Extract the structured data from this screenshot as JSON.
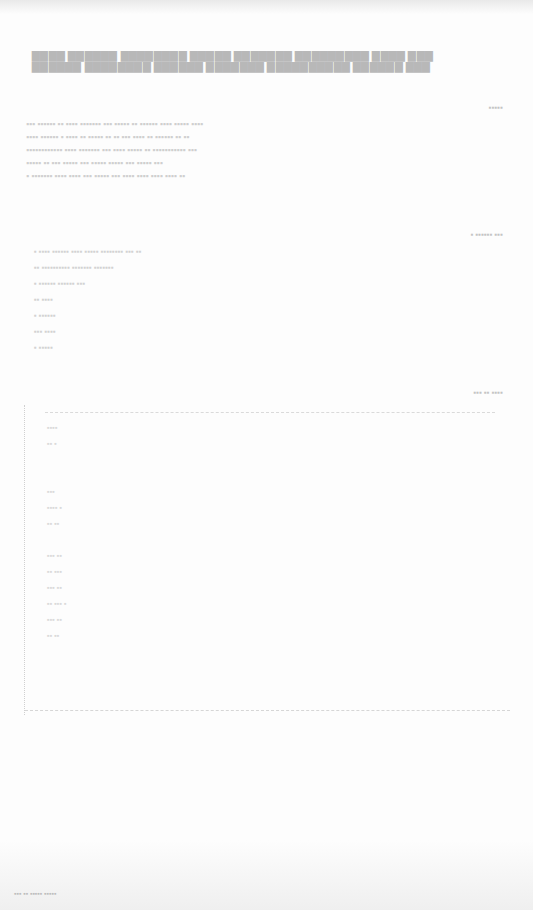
{
  "document": {
    "header_lines": [
      "▇▇▇▇ ▇▇▇▇▇▇ ▇▇▇▇▇▇▇▇ ▇▇▇▇▇ ▇▇▇▇▇▇▇ ▇▇▇▇▇▇▇▇▇ ▇▇▇▇ ▇▇▇",
      "▇▇▇▇▇▇ ▇▇▇▇▇▇▇▇ ▇▇▇▇▇▇ ▇▇▇▇▇▇▇ ▇▇▇▇▇▇▇▇▇▇ ▇▇▇▇▇▇ ▇▇▇"
    ],
    "label_1": "▪▪▪▪▪",
    "paragraph": [
      "▪▪▪ ▪▪▪▪▪▪ ▪▪ ▪▪▪▪ ▪▪▪▪▪▪▪ ▪▪▪ ▪▪▪▪▪ ▪▪ ▪▪▪▪▪▪ ▪▪▪▪ ▪▪▪▪▪ ▪▪▪▪",
      "▪▪▪▪ ▪▪▪▪▪▪ ▪ ▪▪▪▪ ▪▪ ▪▪▪▪▪ ▪▪ ▪▪ ▪▪▪ ▪▪▪▪ ▪▪ ▪▪▪▪▪▪ ▪▪ ▪▪",
      "▪▪▪▪▪▪▪▪▪▪▪▪ ▪▪▪▪ ▪▪▪▪▪▪▪ ▪▪▪ ▪▪▪▪ ▪▪▪▪▪ ▪▪ ▪▪▪▪▪▪▪▪▪▪▪ ▪▪▪",
      "▪▪▪▪▪ ▪▪ ▪▪▪ ▪▪▪▪▪ ▪▪▪ ▪▪▪▪▪ ▪▪▪▪▪ ▪▪▪ ▪▪▪▪▪ ▪▪▪",
      "▪ ▪▪▪▪▪▪▪ ▪▪▪▪ ▪▪▪▪ ▪▪▪ ▪▪▪▪▪ ▪▪▪ ▪▪▪▪ ▪▪▪▪ ▪▪▪▪ ▪▪▪▪ ▪▪"
    ],
    "label_2": "▪ ▪▪▪▪▪▪ ▪▪▪",
    "list_items": [
      "▪ ▪▪▪▪ ▪▪▪▪▪▪   ▪▪▪▪ ▪▪▪▪▪   ▪▪▪▪▪▪▪▪ ▪▪▪   ▪▪",
      "▪▪ ▪▪▪▪▪▪▪▪▪▪   ▪▪▪▪▪▪▪ ▪▪▪▪▪▪▪",
      "▪ ▪▪▪▪▪▪   ▪▪▪▪▪▪   ▪▪▪",
      "▪▪ ▪▪▪▪",
      "▪ ▪▪▪▪▪▪",
      "▪▪▪ ▪▪▪▪",
      "▪ ▪▪▪▪▪"
    ],
    "label_3": "▪▪▪ ▪▪ ▪▪▪▪",
    "figure_entries": [
      "▪▪▪▪",
      "▪▪ ▪",
      "",
      "",
      "▪▪▪",
      "▪▪▪▪ ▪",
      "▪▪ ▪▪",
      "",
      "▪▪▪ ▪▪",
      "▪▪ ▪▪▪",
      "▪▪▪ ▪▪",
      "▪▪ ▪▪▪ ▪",
      "▪▪▪ ▪▪",
      "▪▪ ▪▪"
    ],
    "footer_text": "▪▪▪ ▪▪ ▪▪▪▪▪ ▪▪▪▪▪"
  }
}
